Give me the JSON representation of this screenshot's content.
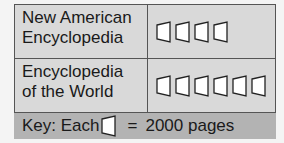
{
  "rows": [
    {
      "label_line1": "New American",
      "label_line2": "Encyclopedia",
      "icon_count": 4
    },
    {
      "label_line1": "Encyclopedia",
      "label_line2": "of the World",
      "icon_count": 6
    }
  ],
  "key": {
    "prefix": "Key: Each",
    "equals": "=",
    "value": "2000 pages"
  },
  "icon": {
    "name": "book-icon",
    "stroke": "#222222",
    "fill": "#ffffff"
  },
  "colors": {
    "cell_bg": "#d9d9d9",
    "key_bg": "#b3b3b3",
    "border": "#555555"
  },
  "chart_data": {
    "type": "pictograph",
    "title": "",
    "categories": [
      "New American Encyclopedia",
      "Encyclopedia of the World"
    ],
    "icons": [
      4,
      6
    ],
    "values": [
      8000,
      12000
    ],
    "unit_per_icon": 2000,
    "unit_label": "pages",
    "key": "Key: Each [book] = 2000 pages"
  }
}
